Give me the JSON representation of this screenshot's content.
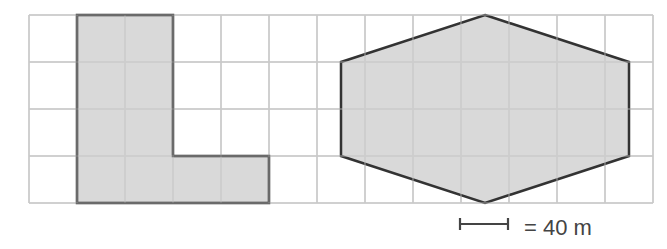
{
  "grid": {
    "cols": 13,
    "rows": 4,
    "x0": 29,
    "y0": 15,
    "cell_w": 48,
    "cell_h": 47,
    "line_color": "#c8c8c8"
  },
  "shapes": {
    "l_shape": {
      "name": "L-shaped figure",
      "fill": "#d2d2d2",
      "stroke": "#333333",
      "grid_points": [
        [
          1,
          0
        ],
        [
          3,
          0
        ],
        [
          3,
          3
        ],
        [
          5,
          3
        ],
        [
          5,
          4
        ],
        [
          1,
          4
        ]
      ]
    },
    "hexagon": {
      "name": "hexagon",
      "fill": "#d2d2d2",
      "stroke": "#333333",
      "grid_points": [
        [
          9.5,
          0
        ],
        [
          12.5,
          1
        ],
        [
          12.5,
          3
        ],
        [
          9.5,
          4
        ],
        [
          6.5,
          3
        ],
        [
          6.5,
          1
        ]
      ]
    }
  },
  "scale": {
    "bar_cells": 1,
    "label": "= 40 m"
  }
}
